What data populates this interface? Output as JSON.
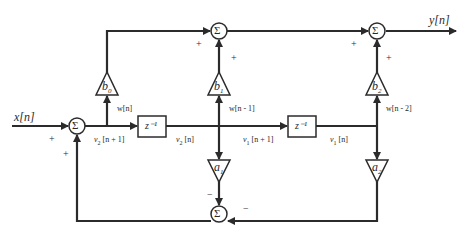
{
  "diagram": {
    "input_label": "x[n]",
    "output_label": "y[n]",
    "sum_symbol": "Σ",
    "delay_label": "z⁻¹",
    "coefficients": {
      "b0": "b0",
      "b1": "b1",
      "b2": "b2",
      "a1": "a1",
      "a2": "a2"
    },
    "coef_base": {
      "b": "b",
      "a": "a"
    },
    "coef_sub": {
      "b0": "0",
      "b1": "1",
      "b2": "2",
      "a1": "1",
      "a2": "2"
    },
    "signals": {
      "w_n": "w[n]",
      "w_n1": "w[n - 1]",
      "w_n2": "w[n - 2]",
      "v2_n1": {
        "base": "v",
        "sub": "2",
        "arg": " [n + 1]"
      },
      "v2_n": {
        "base": "v",
        "sub": "2",
        "arg": " [n]"
      },
      "v1_n1": {
        "base": "v",
        "sub": "1",
        "arg": " [n + 1]"
      },
      "v1_n": {
        "base": "v",
        "sub": "1",
        "arg": " [n]"
      }
    },
    "signs": {
      "plus": "+",
      "minus": "−"
    },
    "line_color": "#2b2b2b"
  }
}
